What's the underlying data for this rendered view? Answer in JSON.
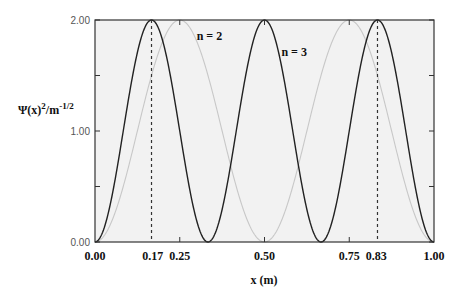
{
  "chart_data": {
    "type": "line",
    "title": "",
    "xlabel": "x (m)",
    "ylabel": "Ψ(x)²/m⁻¹/²",
    "ylabel_parts": {
      "base": "Ψ(x)",
      "sup1": "2",
      "mid": "/m",
      "sup2": "-1/2"
    },
    "xlim": [
      0,
      1
    ],
    "ylim": [
      0,
      2
    ],
    "grid": false,
    "legend": "none",
    "x_ticks": [
      0.0,
      0.17,
      0.25,
      0.5,
      0.75,
      0.83,
      1.0
    ],
    "x_tick_labels": [
      "0.00",
      "0.17",
      "0.25",
      "0.50",
      "0.75",
      "0.83",
      "1.00"
    ],
    "y_ticks": [
      0.0,
      0.5,
      1.0,
      1.5,
      2.0
    ],
    "y_tick_labels": [
      "0.00",
      "1.00",
      "2.00"
    ],
    "y_tick_label_values": [
      0.0,
      1.0,
      2.0
    ],
    "series": [
      {
        "name": "n = 2",
        "formula": "2*sin^2(2*pi*x)",
        "n": 2,
        "color": "#c8c8c8",
        "amplitude": 2.0,
        "x": [
          0,
          0.125,
          0.25,
          0.375,
          0.5,
          0.625,
          0.75,
          0.875,
          1.0
        ],
        "values": [
          0,
          1.0,
          2.0,
          1.0,
          0,
          1.0,
          2.0,
          1.0,
          0
        ]
      },
      {
        "name": "n = 3",
        "formula": "2*sin^2(3*pi*x)",
        "n": 3,
        "color": "#222222",
        "amplitude": 2.0,
        "x": [
          0,
          0.0833,
          0.1667,
          0.25,
          0.3333,
          0.4167,
          0.5,
          0.5833,
          0.6667,
          0.75,
          0.8333,
          0.9167,
          1.0
        ],
        "values": [
          0,
          1.0,
          2.0,
          1.0,
          0,
          1.0,
          2.0,
          1.0,
          0,
          1.0,
          2.0,
          1.0,
          0
        ]
      }
    ],
    "annotations": [
      {
        "text": "n = 2",
        "x": 0.3,
        "y": 1.82
      },
      {
        "text": "n = 3",
        "x": 0.55,
        "y": 1.68
      }
    ],
    "vlines": [
      {
        "x": 0.1667,
        "style": "dashed"
      },
      {
        "x": 0.8333,
        "style": "dashed"
      }
    ]
  },
  "style": {
    "plot_bg": "#f2f2f2",
    "axis_color": "#333333",
    "vline_color": "#333333"
  }
}
